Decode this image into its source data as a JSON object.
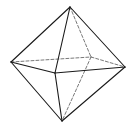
{
  "figure": {
    "stroke_color": "#1a1a1a",
    "hidden_stroke_color": "#555555",
    "background": "#ffffff",
    "vertices": {
      "top": [
        70,
        7
      ],
      "left": [
        11,
        62
      ],
      "right": [
        125,
        67
      ],
      "front": [
        55,
        73
      ],
      "back": [
        91,
        57
      ],
      "bottom": [
        62,
        121
      ]
    },
    "visible_edges": [
      [
        "top",
        "left"
      ],
      [
        "top",
        "right"
      ],
      [
        "top",
        "front"
      ],
      [
        "left",
        "front"
      ],
      [
        "front",
        "right"
      ],
      [
        "left",
        "bottom"
      ],
      [
        "front",
        "bottom"
      ],
      [
        "right",
        "bottom"
      ]
    ],
    "hidden_edges": [
      [
        "top",
        "back"
      ],
      [
        "left",
        "back"
      ],
      [
        "back",
        "right"
      ],
      [
        "back",
        "bottom"
      ]
    ]
  }
}
